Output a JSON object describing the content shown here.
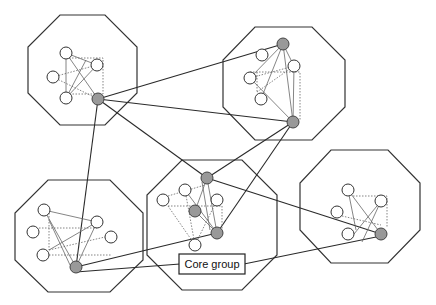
{
  "diagram": {
    "label": "Core group",
    "colors": {
      "core_node": "#999999",
      "member_node": "#ffffff",
      "stroke": "#333333"
    },
    "clusters": [
      {
        "id": "cluster-1",
        "members": 4,
        "core_nodes": 1
      },
      {
        "id": "cluster-2",
        "members": 4,
        "core_nodes": 2
      },
      {
        "id": "cluster-3",
        "members": 4,
        "core_nodes": 3
      },
      {
        "id": "cluster-4",
        "members": 5,
        "core_nodes": 1
      },
      {
        "id": "cluster-5",
        "members": 4,
        "core_nodes": 1
      }
    ]
  }
}
